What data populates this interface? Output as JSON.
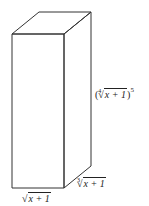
{
  "diagram": {
    "type": "rectangular-prism",
    "stroke_color": "#333333",
    "background": "#ffffff",
    "labels": {
      "height": {
        "open": "(",
        "index": "4",
        "radicand": "x + 1",
        "close": ")",
        "exponent": "5"
      },
      "depth": {
        "index": "3",
        "radicand": "x + 1"
      },
      "width": {
        "radical": "√",
        "radicand": "x + 1"
      }
    }
  }
}
